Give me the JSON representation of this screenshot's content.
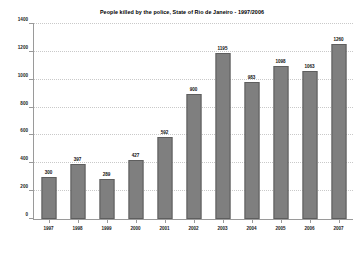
{
  "chart_data": {
    "type": "bar",
    "title": "People killed by the police, State of Rio de Janeiro - 1997/2006",
    "xlabel": "",
    "ylabel": "",
    "categories": [
      "1997",
      "1998",
      "1999",
      "2000",
      "2001",
      "2002",
      "2003",
      "2004",
      "2005",
      "2006",
      "2007"
    ],
    "values": [
      300,
      397,
      289,
      427,
      592,
      900,
      1195,
      983,
      1098,
      1063,
      1260
    ],
    "value_labels": [
      "300",
      "397",
      "289",
      "427",
      "592",
      "900",
      "1195",
      "983",
      "1098",
      "1063",
      "1260"
    ],
    "ylim": [
      0,
      1400
    ],
    "yticks": [
      0,
      200,
      400,
      600,
      800,
      1000,
      1200,
      1400
    ],
    "ytick_labels": [
      "0",
      "200",
      "400",
      "600",
      "800",
      "1000",
      "1200",
      "1400"
    ],
    "grid": true,
    "legend": null,
    "bar_color": "#7f7f7f",
    "bar_border_color": "#5e5e5e",
    "axis_color": "#9a9a9a",
    "background_color": "#ffffff",
    "text_color": "#000000"
  }
}
